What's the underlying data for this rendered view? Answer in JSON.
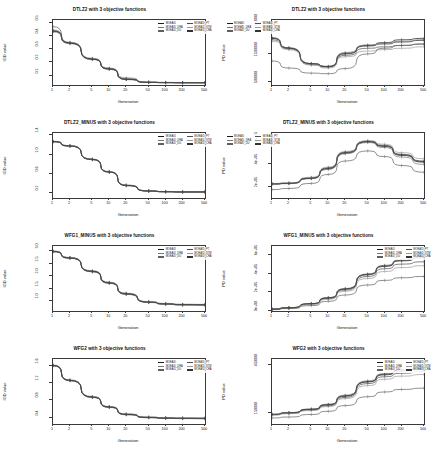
{
  "figure": {
    "columns": 2,
    "rows": 4,
    "xlabel": "Generation",
    "ylabel_left": "IGD value",
    "ylabel_right": "PD value",
    "x_ticks": [
      "1",
      "2",
      "5",
      "10",
      "20",
      "50",
      "100",
      "200",
      "500"
    ],
    "x_scale": "log",
    "legend_entries": [
      {
        "label": "MOEA/D",
        "color": "#1a1a1a"
      },
      {
        "label": "MOEA/D_PT",
        "color": "#4d4d4d"
      },
      {
        "label": "MOEA/D_DRA",
        "color": "#777777"
      },
      {
        "label": "MOEA/D_STM",
        "color": "#9a9a9a"
      },
      {
        "label": "MOEA/D_DU",
        "color": "#5f5f5f"
      },
      {
        "label": "MOEA/D_CRA",
        "color": "#333333"
      }
    ],
    "series_names": [
      "MOEA/D",
      "MOEA/D_PT",
      "MOEA/D_DRA",
      "MOEA/D_STM",
      "MOEA/D_DU",
      "MOEA/D_CRA"
    ]
  },
  "chart_data": [
    {
      "type": "line",
      "title": "DTLZ2 with 3 objective functions",
      "xlabel": "Generation",
      "ylabel": "IGD value",
      "x": [
        1,
        2,
        5,
        10,
        20,
        50,
        100,
        200,
        500
      ],
      "xlim": [
        1,
        500
      ],
      "ylim": [
        0.03,
        0.52
      ],
      "y_ticks": [
        "0.1",
        "0.2",
        "0.3",
        "0.4",
        "0.5"
      ],
      "y_tick_values": [
        0.1,
        0.2,
        0.3,
        0.4,
        0.5
      ],
      "grid": false,
      "legend_position": "top-right",
      "series": [
        {
          "name": "MOEA/D",
          "values": [
            0.435,
            0.345,
            0.225,
            0.15,
            0.072,
            0.05,
            0.048,
            0.047,
            0.047
          ]
        },
        {
          "name": "MOEA/D_PT",
          "values": [
            0.44,
            0.35,
            0.228,
            0.152,
            0.074,
            0.051,
            0.049,
            0.048,
            0.048
          ]
        },
        {
          "name": "MOEA/D_DRA",
          "values": [
            0.43,
            0.342,
            0.222,
            0.148,
            0.07,
            0.049,
            0.047,
            0.046,
            0.046
          ]
        },
        {
          "name": "MOEA/D_STM",
          "values": [
            0.445,
            0.352,
            0.232,
            0.158,
            0.085,
            0.053,
            0.05,
            0.049,
            0.049
          ]
        },
        {
          "name": "MOEA/D_DU",
          "values": [
            0.47,
            0.348,
            0.226,
            0.155,
            0.078,
            0.051,
            0.048,
            0.047,
            0.047
          ]
        },
        {
          "name": "MOEA/D_CRA",
          "values": [
            0.438,
            0.346,
            0.224,
            0.151,
            0.073,
            0.05,
            0.048,
            0.047,
            0.047
          ]
        }
      ]
    },
    {
      "type": "line",
      "title": "DTLZ2 with 3 objective functions",
      "xlabel": "Generation",
      "ylabel": "PD value",
      "x": [
        1,
        2,
        5,
        10,
        20,
        50,
        100,
        200,
        500
      ],
      "xlim": [
        1,
        500
      ],
      "ylim": [
        400000,
        2700000
      ],
      "y_ticks": [
        "500000",
        "1500000",
        "2500000"
      ],
      "y_tick_values": [
        500000,
        1500000,
        2500000
      ],
      "grid": false,
      "legend_position": "top-left",
      "series": [
        {
          "name": "MOEA/D",
          "values": [
            2050000,
            1700000,
            1150000,
            1050000,
            1500000,
            1800000,
            1900000,
            2000000,
            2050000
          ]
        },
        {
          "name": "MOEA/D_PT",
          "values": [
            2000000,
            1680000,
            1120000,
            1030000,
            1450000,
            1700000,
            1750000,
            1800000,
            1850000
          ]
        },
        {
          "name": "MOEA/D_DRA",
          "values": [
            2080000,
            1720000,
            1160000,
            1060000,
            1550000,
            1820000,
            1880000,
            1950000,
            2000000
          ]
        },
        {
          "name": "MOEA/D_STM",
          "values": [
            1950000,
            1650000,
            1100000,
            1000000,
            1400000,
            1600000,
            1650000,
            1700000,
            1750000
          ]
        },
        {
          "name": "MOEA/D_DU",
          "values": [
            1250000,
            1000000,
            820000,
            800000,
            980000,
            1500000,
            1700000,
            1800000,
            1850000
          ]
        },
        {
          "name": "MOEA/D_CRA",
          "values": [
            2060000,
            1710000,
            1155000,
            1055000,
            1520000,
            1780000,
            1850000,
            1920000,
            1980000
          ]
        }
      ]
    },
    {
      "type": "line",
      "title": "DTLZ2_MINUS with 3 objective functions",
      "xlabel": "Generation",
      "ylabel": "IGD value",
      "x": [
        1,
        2,
        5,
        10,
        20,
        50,
        100,
        200,
        500
      ],
      "xlim": [
        1,
        500
      ],
      "ylim": [
        0.1,
        1.45
      ],
      "y_ticks": [
        "0.2",
        "0.6",
        "1.0",
        "1.4"
      ],
      "y_tick_values": [
        0.2,
        0.6,
        1.0,
        1.4
      ],
      "grid": false,
      "legend_position": "top-right",
      "series": [
        {
          "name": "MOEA/D",
          "values": [
            1.27,
            1.18,
            0.9,
            0.64,
            0.36,
            0.245,
            0.23,
            0.225,
            0.225
          ]
        },
        {
          "name": "MOEA/D_PT",
          "values": [
            1.275,
            1.185,
            0.905,
            0.645,
            0.365,
            0.248,
            0.233,
            0.228,
            0.228
          ]
        },
        {
          "name": "MOEA/D_DRA",
          "values": [
            1.265,
            1.175,
            0.895,
            0.635,
            0.355,
            0.242,
            0.228,
            0.223,
            0.223
          ]
        },
        {
          "name": "MOEA/D_STM",
          "values": [
            1.28,
            1.19,
            0.91,
            0.65,
            0.37,
            0.252,
            0.236,
            0.231,
            0.231
          ]
        },
        {
          "name": "MOEA/D_DU",
          "values": [
            1.268,
            1.178,
            0.898,
            0.638,
            0.358,
            0.244,
            0.229,
            0.224,
            0.224
          ]
        },
        {
          "name": "MOEA/D_CRA",
          "values": [
            1.272,
            1.182,
            0.902,
            0.642,
            0.362,
            0.246,
            0.231,
            0.226,
            0.226
          ]
        }
      ]
    },
    {
      "type": "line",
      "title": "DTLZ2_MINUS with 3 objective functions",
      "xlabel": "Generation",
      "ylabel": "PD value",
      "x": [
        1,
        2,
        5,
        10,
        20,
        50,
        100,
        200,
        500
      ],
      "xlim": [
        1,
        500
      ],
      "ylim": [
        100000,
        680000
      ],
      "y_ticks": [
        "2e+05",
        "4e+05",
        "6e+05"
      ],
      "y_tick_values": [
        200000,
        400000,
        600000
      ],
      "grid": false,
      "legend_position": "top-left",
      "series": [
        {
          "name": "MOEA/D",
          "values": [
            225000,
            230000,
            275000,
            360000,
            500000,
            600000,
            560000,
            480000,
            420000
          ]
        },
        {
          "name": "MOEA/D_PT",
          "values": [
            228000,
            233000,
            280000,
            370000,
            510000,
            608000,
            570000,
            490000,
            430000
          ]
        },
        {
          "name": "MOEA/D_DRA",
          "values": [
            222000,
            228000,
            272000,
            355000,
            495000,
            595000,
            550000,
            465000,
            400000
          ]
        },
        {
          "name": "MOEA/D_STM",
          "values": [
            230000,
            235000,
            285000,
            375000,
            515000,
            612000,
            580000,
            505000,
            450000
          ]
        },
        {
          "name": "MOEA/D_DU",
          "values": [
            175000,
            185000,
            230000,
            310000,
            430000,
            520000,
            470000,
            390000,
            330000
          ]
        },
        {
          "name": "MOEA/D_CRA",
          "values": [
            226000,
            231000,
            277000,
            365000,
            505000,
            604000,
            565000,
            485000,
            425000
          ]
        }
      ]
    },
    {
      "type": "line",
      "title": "WFG1_MINUS with 3 objective functions",
      "xlabel": "Generation",
      "ylabel": "IGD value",
      "x": [
        1,
        2,
        5,
        10,
        20,
        50,
        100,
        200,
        500
      ],
      "xlim": [
        1,
        500
      ],
      "ylim": [
        0.6,
        3.2
      ],
      "y_ticks": [
        "1.0",
        "1.5",
        "2.0",
        "2.5",
        "3.0"
      ],
      "y_tick_values": [
        1.0,
        1.5,
        2.0,
        2.5,
        3.0
      ],
      "grid": false,
      "legend_position": "top-right",
      "series": [
        {
          "name": "MOEA/D",
          "values": [
            2.98,
            2.72,
            2.18,
            1.72,
            1.28,
            0.95,
            0.88,
            0.85,
            0.845
          ]
        },
        {
          "name": "MOEA/D_PT",
          "values": [
            2.99,
            2.735,
            2.2,
            1.74,
            1.3,
            0.965,
            0.895,
            0.862,
            0.858
          ]
        },
        {
          "name": "MOEA/D_DRA",
          "values": [
            2.965,
            2.705,
            2.165,
            1.705,
            1.265,
            0.94,
            0.87,
            0.84,
            0.835
          ]
        },
        {
          "name": "MOEA/D_STM",
          "values": [
            3.0,
            2.745,
            2.215,
            1.755,
            1.315,
            0.975,
            0.905,
            0.872,
            0.868
          ]
        },
        {
          "name": "MOEA/D_DU",
          "values": [
            2.975,
            2.715,
            2.175,
            1.715,
            1.275,
            0.948,
            0.876,
            0.846,
            0.842
          ]
        },
        {
          "name": "MOEA/D_CRA",
          "values": [
            2.985,
            2.728,
            2.19,
            1.73,
            1.29,
            0.958,
            0.886,
            0.855,
            0.851
          ]
        }
      ]
    },
    {
      "type": "line",
      "title": "WFG1_MINUS with 3 objective functions",
      "xlabel": "Generation",
      "ylabel": "PD value",
      "x": [
        1,
        2,
        5,
        10,
        20,
        50,
        100,
        200,
        500
      ],
      "xlim": [
        1,
        500
      ],
      "ylim": [
        0,
        700000
      ],
      "y_ticks": [
        "0e+00",
        "2e+05",
        "4e+05",
        "6e+05"
      ],
      "y_tick_values": [
        0,
        200000,
        400000,
        600000
      ],
      "grid": false,
      "legend_position": "top-right",
      "series": [
        {
          "name": "MOEA/D",
          "values": [
            20000,
            35000,
            78000,
            140000,
            235000,
            390000,
            480000,
            540000,
            575000
          ]
        },
        {
          "name": "MOEA/D_PT",
          "values": [
            19000,
            33000,
            74000,
            133000,
            225000,
            372000,
            455000,
            505000,
            530000
          ]
        },
        {
          "name": "MOEA/D_DRA",
          "values": [
            21000,
            36000,
            80000,
            145000,
            242000,
            400000,
            492000,
            552000,
            588000
          ]
        },
        {
          "name": "MOEA/D_STM",
          "values": [
            18000,
            31000,
            70000,
            126000,
            212000,
            350000,
            425000,
            468000,
            488000
          ]
        },
        {
          "name": "MOEA/D_DU",
          "values": [
            15000,
            26000,
            58000,
            104000,
            172000,
            280000,
            330000,
            358000,
            372000
          ]
        },
        {
          "name": "MOEA/D_CRA",
          "values": [
            20500,
            35500,
            79000,
            142000,
            238000,
            395000,
            486000,
            546000,
            580000
          ]
        }
      ]
    },
    {
      "type": "line",
      "title": "WFG2 with 3 objective functions",
      "xlabel": "Generation",
      "ylabel": "IGD value",
      "x": [
        1,
        2,
        5,
        10,
        20,
        50,
        100,
        200,
        500
      ],
      "xlim": [
        1,
        500
      ],
      "ylim": [
        0.25,
        1.75
      ],
      "y_ticks": [
        "0.4",
        "0.8",
        "1.2",
        "1.6"
      ],
      "y_tick_values": [
        0.4,
        0.8,
        1.2,
        1.6
      ],
      "grid": false,
      "legend_position": "top-right",
      "series": [
        {
          "name": "MOEA/D",
          "values": [
            1.6,
            1.255,
            0.87,
            0.64,
            0.47,
            0.4,
            0.385,
            0.38,
            0.378
          ]
        },
        {
          "name": "MOEA/D_PT",
          "values": [
            1.605,
            1.262,
            0.878,
            0.648,
            0.478,
            0.407,
            0.392,
            0.386,
            0.384
          ]
        },
        {
          "name": "MOEA/D_DRA",
          "values": [
            1.592,
            1.248,
            0.862,
            0.632,
            0.462,
            0.394,
            0.379,
            0.374,
            0.372
          ]
        },
        {
          "name": "MOEA/D_STM",
          "values": [
            1.612,
            1.27,
            0.885,
            0.655,
            0.485,
            0.413,
            0.398,
            0.392,
            0.39
          ]
        },
        {
          "name": "MOEA/D_DU",
          "values": [
            1.596,
            1.252,
            0.866,
            0.636,
            0.466,
            0.397,
            0.382,
            0.377,
            0.375
          ]
        },
        {
          "name": "MOEA/D_CRA",
          "values": [
            1.602,
            1.258,
            0.874,
            0.644,
            0.474,
            0.403,
            0.388,
            0.383,
            0.381
          ]
        }
      ]
    },
    {
      "type": "line",
      "title": "WFG2 with 3 objective functions",
      "xlabel": "Generation",
      "ylabel": "PD value",
      "x": [
        1,
        2,
        5,
        10,
        20,
        50,
        100,
        200,
        500
      ],
      "xlim": [
        1,
        500
      ],
      "ylim": [
        80000,
        490000
      ],
      "y_ticks": [
        "150000",
        "450000"
      ],
      "y_tick_values": [
        150000,
        450000
      ],
      "grid": false,
      "legend_position": "top-right",
      "series": [
        {
          "name": "MOEA/D",
          "values": [
            140000,
            150000,
            172000,
            200000,
            255000,
            345000,
            390000,
            415000,
            428000
          ]
        },
        {
          "name": "MOEA/D_PT",
          "values": [
            138000,
            147000,
            168000,
            195000,
            248000,
            335000,
            378000,
            400000,
            412000
          ]
        },
        {
          "name": "MOEA/D_DRA",
          "values": [
            142000,
            152000,
            175000,
            205000,
            262000,
            352000,
            398000,
            424000,
            438000
          ]
        },
        {
          "name": "MOEA/D_STM",
          "values": [
            136000,
            145000,
            165000,
            190000,
            240000,
            322000,
            362000,
            382000,
            392000
          ]
        },
        {
          "name": "MOEA/D_DU",
          "values": [
            118000,
            124000,
            140000,
            160000,
            196000,
            252000,
            282000,
            298000,
            306000
          ]
        },
        {
          "name": "MOEA/D_CRA",
          "values": [
            141000,
            151000,
            173000,
            202000,
            258000,
            348000,
            394000,
            419000,
            433000
          ]
        }
      ]
    }
  ]
}
